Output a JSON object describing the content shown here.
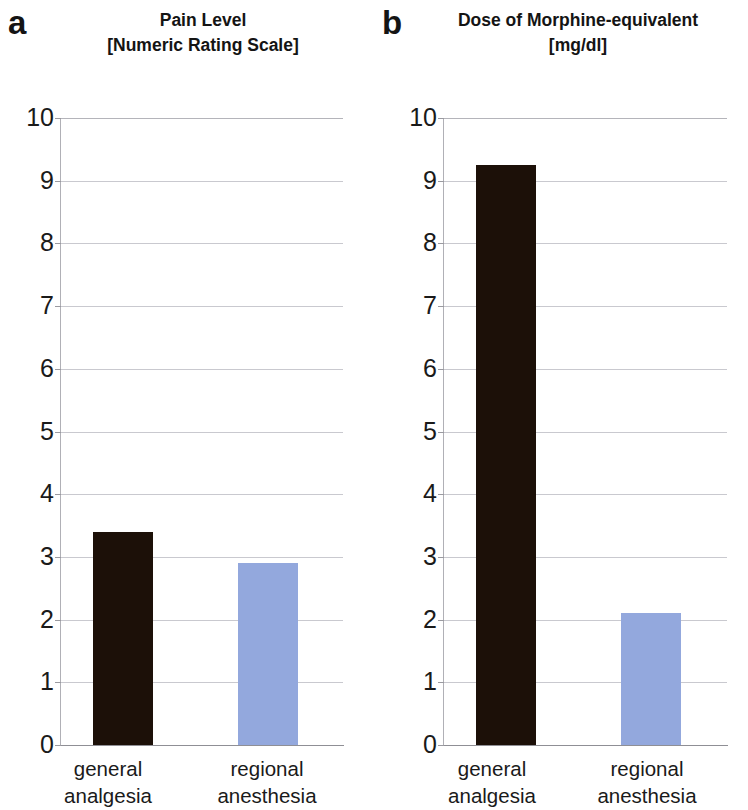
{
  "figure": {
    "width": 748,
    "height": 810,
    "background": "#ffffff"
  },
  "panels": [
    {
      "letter": "a",
      "title_line1": "Pain Level",
      "title_line2": "[Numeric Rating Scale]"
    },
    {
      "letter": "b",
      "title_line1": "Dose of Morphine-equivalent",
      "title_line2": "[mg/dl]"
    }
  ],
  "colors": {
    "bar_dark": "#1c1008",
    "bar_light": "#93a8dd",
    "gridline": "#c9c9cf",
    "axis": "#8f8f95",
    "text": "#1a1a1a"
  },
  "axis": {
    "tick_labels": [
      "10",
      "9",
      "8",
      "7",
      "6",
      "5",
      "4",
      "3",
      "2",
      "1",
      "0"
    ],
    "category_line1": [
      "general",
      "regional"
    ],
    "category_line2": [
      "analgesia",
      "anesthesia"
    ]
  },
  "chart_data": [
    {
      "type": "bar",
      "panel": "a",
      "title": "Pain Level [Numeric Rating Scale]",
      "xlabel": "",
      "ylabel": "Pain Level [Numeric Rating Scale]",
      "ylim": [
        0,
        10
      ],
      "ytick_step": 1,
      "grid": true,
      "legend": "none",
      "categories": [
        "general analgesia",
        "regional anesthesia"
      ],
      "values": [
        3.4,
        2.9
      ],
      "bar_colors": [
        "#1c1008",
        "#93a8dd"
      ]
    },
    {
      "type": "bar",
      "panel": "b",
      "title": "Dose of Morphine-equivalent [mg/dl]",
      "xlabel": "",
      "ylabel": "Dose of Morphine-equivalent [mg/dl]",
      "ylim": [
        0,
        10
      ],
      "ytick_step": 1,
      "grid": true,
      "legend": "none",
      "categories": [
        "general analgesia",
        "regional anesthesia"
      ],
      "values": [
        9.25,
        2.1
      ],
      "bar_colors": [
        "#1c1008",
        "#93a8dd"
      ]
    }
  ]
}
